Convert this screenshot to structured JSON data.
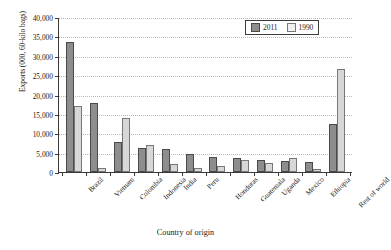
{
  "chart_data": {
    "type": "bar",
    "title": "",
    "xlabel": "Country of origin",
    "ylabel": "Exports (000, 60-kilo bags)",
    "ylim": [
      0,
      40000
    ],
    "ytick_labels": [
      "0",
      "5,000",
      "10,000",
      "15,000",
      "20,000",
      "25,000",
      "30,000",
      "35,000",
      "40,000"
    ],
    "ytick_values": [
      0,
      5000,
      10000,
      15000,
      20000,
      25000,
      30000,
      35000,
      40000
    ],
    "grid": true,
    "legend_position": "top-right",
    "categories": [
      "Brazil",
      "Vietnam",
      "Colombia",
      "Indonesia",
      "India",
      "Peru",
      "Honduras",
      "Guatemala",
      "Uganda",
      "Mexico",
      "Ethiopia",
      "Rest of world"
    ],
    "series": [
      {
        "name": "2011",
        "color": "#8d8d8d",
        "values": [
          33500,
          17700,
          7800,
          6200,
          5900,
          4700,
          3900,
          3600,
          3100,
          2800,
          2500,
          12400
        ]
      },
      {
        "name": "1990",
        "color": "#d7d7d7",
        "values": [
          17000,
          1100,
          14000,
          6900,
          2000,
          1100,
          1600,
          3200,
          2300,
          3500,
          900,
          26500
        ]
      }
    ]
  },
  "legend": {
    "items": [
      {
        "label": "2011"
      },
      {
        "label": "1990"
      }
    ]
  }
}
